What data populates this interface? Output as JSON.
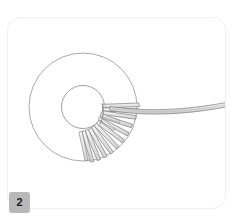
{
  "panel": {
    "index_label": "2",
    "background_color": "#ffffff",
    "border_color": "#f0f0f0",
    "badge_color": "#b8b8b8",
    "badge_text_color": "#1a1a1a"
  },
  "illustration": {
    "title": "Annular disk with radial blade fan and curved ribbon tail",
    "type": "line-drawing",
    "stroke_color": "#8a8a8a",
    "fill_color": "#f4f4f4",
    "blade_fill_color": "#e9e9e9",
    "blade_stroke_color": "#7d7d7d",
    "ribbon_fill_color": "#ededed",
    "annulus": {
      "center_x": 83,
      "center_y": 107,
      "outer_radius": 54,
      "inner_radius": 21.5
    },
    "blade_fan": {
      "count": 14,
      "start_angle_deg": -4,
      "end_angle_deg": 108,
      "inner_radius": 21,
      "outer_radius": 56,
      "blade_width": 3.4
    },
    "ribbon_tail": {
      "start_x": 110,
      "start_y": 109,
      "end_x": 241,
      "end_y": 103,
      "thickness": 4
    }
  }
}
